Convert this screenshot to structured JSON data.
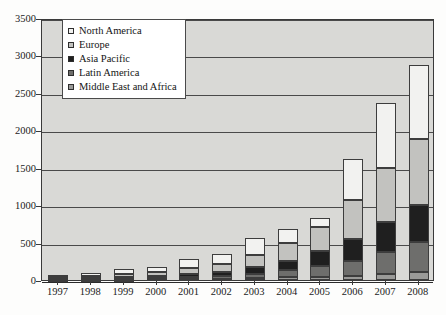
{
  "chart_data": {
    "type": "bar",
    "stacked": true,
    "title": "",
    "xlabel": "",
    "ylabel": "",
    "ylim": [
      0,
      3500
    ],
    "ytick_step": 500,
    "yticks": [
      0,
      500,
      1000,
      1500,
      2000,
      2500,
      3000,
      3500
    ],
    "grid": true,
    "legend_position": "top-left-inside",
    "categories": [
      "1997",
      "1998",
      "1999",
      "2000",
      "2001",
      "2002",
      "2003",
      "2004",
      "2005",
      "2006",
      "2007",
      "2008"
    ],
    "series": [
      {
        "name": "Middle East and Africa",
        "color": "#9a9a98",
        "values": [
          2,
          3,
          5,
          8,
          12,
          18,
          25,
          35,
          45,
          60,
          80,
          110
        ]
      },
      {
        "name": "Latin America",
        "color": "#6e6e6c",
        "values": [
          5,
          8,
          12,
          18,
          28,
          40,
          60,
          95,
          140,
          200,
          300,
          400
        ]
      },
      {
        "name": "Asia Pacific",
        "color": "#1f1f1f",
        "values": [
          8,
          12,
          18,
          25,
          40,
          55,
          85,
          130,
          200,
          290,
          400,
          490
        ]
      },
      {
        "name": "Europe",
        "color": "#c2c2bf",
        "values": [
          20,
          28,
          45,
          55,
          80,
          105,
          160,
          230,
          320,
          520,
          720,
          890
        ]
      },
      {
        "name": "North America",
        "color": "#f2f2f0",
        "values": [
          35,
          44,
          65,
          69,
          115,
          132,
          225,
          190,
          125,
          540,
          860,
          980
        ]
      }
    ],
    "totals": [
      70,
      95,
      145,
      175,
      275,
      350,
      555,
      680,
      830,
      1610,
      2360,
      2870
    ]
  },
  "legend": {
    "items": [
      {
        "label": "North America",
        "swatch": "legend-swatch-north-america"
      },
      {
        "label": "Europe",
        "swatch": "legend-swatch-europe"
      },
      {
        "label": "Asia Pacific",
        "swatch": "legend-swatch-asia-pacific"
      },
      {
        "label": "Latin America",
        "swatch": "legend-swatch-latin-america"
      },
      {
        "label": "Middle East and Africa",
        "swatch": "legend-swatch-middle-east-and-africa"
      }
    ]
  }
}
